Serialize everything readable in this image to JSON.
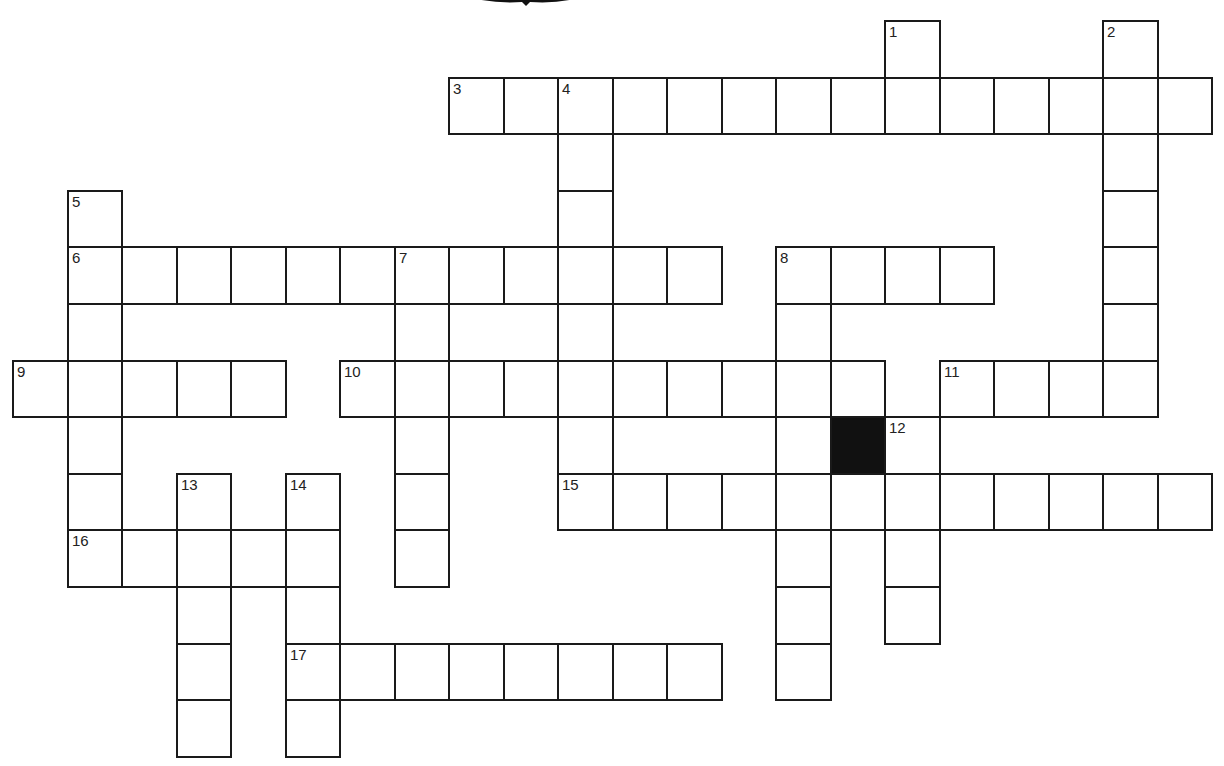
{
  "puzzle": {
    "type": "crossword",
    "grid": {
      "origin_x": 12,
      "origin_y": 20,
      "cell_w": 54.5,
      "cell_h": 56.6
    },
    "words": [
      {
        "number": "1",
        "direction": "down",
        "col": 16,
        "row": 0,
        "length": 2
      },
      {
        "number": "2",
        "direction": "down",
        "col": 20,
        "row": 0,
        "length": 7
      },
      {
        "number": "3",
        "direction": "across",
        "col": 8,
        "row": 1,
        "length": 14
      },
      {
        "number": "4",
        "direction": "down",
        "col": 10,
        "row": 1,
        "length": 8
      },
      {
        "number": "5",
        "direction": "down",
        "col": 1,
        "row": 3,
        "length": 7
      },
      {
        "number": "6",
        "direction": "across",
        "col": 1,
        "row": 4,
        "length": 12
      },
      {
        "number": "7",
        "direction": "down",
        "col": 7,
        "row": 4,
        "length": 6
      },
      {
        "number": "8",
        "direction": "across",
        "col": 14,
        "row": 4,
        "length": 4
      },
      {
        "number": "8",
        "direction": "down",
        "col": 14,
        "row": 4,
        "length": 8
      },
      {
        "number": "9",
        "direction": "across",
        "col": 0,
        "row": 6,
        "length": 5
      },
      {
        "number": "10",
        "direction": "across",
        "col": 6,
        "row": 6,
        "length": 10
      },
      {
        "number": "11",
        "direction": "across",
        "col": 17,
        "row": 6,
        "length": 4
      },
      {
        "number": "12",
        "direction": "down",
        "col": 16,
        "row": 7,
        "length": 4
      },
      {
        "number": "13",
        "direction": "down",
        "col": 3,
        "row": 8,
        "length": 5
      },
      {
        "number": "14",
        "direction": "down",
        "col": 5,
        "row": 8,
        "length": 5
      },
      {
        "number": "15",
        "direction": "across",
        "col": 10,
        "row": 8,
        "length": 12
      },
      {
        "number": "16",
        "direction": "across",
        "col": 1,
        "row": 9,
        "length": 5
      },
      {
        "number": "17",
        "direction": "across",
        "col": 5,
        "row": 11,
        "length": 8
      }
    ],
    "black_cells": [
      {
        "col": 15,
        "row": 7
      }
    ],
    "colors": {
      "line": "#1a1a1a",
      "black_cell": "#111111",
      "background": "#ffffff"
    }
  }
}
